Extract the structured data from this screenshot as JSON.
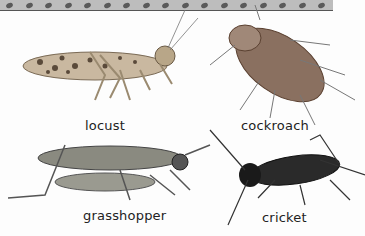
{
  "figure": {
    "decor_strip": {
      "color": "#bdbdbd",
      "dot_color": "#5a5a5a",
      "dot_count": 17
    },
    "insects": [
      {
        "name": "locust",
        "label": "locust"
      },
      {
        "name": "cockroach",
        "label": "cockroach"
      },
      {
        "name": "grasshopper",
        "label": "grasshopper"
      },
      {
        "name": "cricket",
        "label": "cricket"
      }
    ]
  }
}
